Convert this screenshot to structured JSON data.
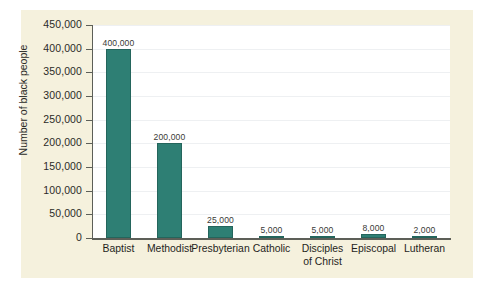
{
  "chart_data": {
    "type": "bar",
    "title": "",
    "subtitle": "",
    "xlabel": "",
    "ylabel": "Number of black people",
    "ylim": [
      0,
      450000
    ],
    "ytick_step": 50000,
    "grid": true,
    "legend": "none",
    "bar_color": "#2e7f74",
    "plot_background": "#ffffff",
    "panel_background": "#f5f1dd",
    "categories": [
      "Baptist",
      "Methodist",
      "Presbyterian",
      "Catholic",
      "Disciples of Christ",
      "Episcopal",
      "Lutheran"
    ],
    "category_lines": [
      [
        "Baptist"
      ],
      [
        "Methodist"
      ],
      [
        "Presbyterian"
      ],
      [
        "Catholic"
      ],
      [
        "Disciples",
        "of Christ"
      ],
      [
        "Episcopal"
      ],
      [
        "Lutheran"
      ]
    ],
    "values": [
      400000,
      200000,
      25000,
      5000,
      5000,
      8000,
      2000
    ],
    "value_labels": [
      "400,000",
      "200,000",
      "25,000",
      "5,000",
      "5,000",
      "8,000",
      "2,000"
    ],
    "ytick_labels": [
      "450,000",
      "400,000",
      "350,000",
      "300,000",
      "250,000",
      "200,000",
      "150,000",
      "100,000",
      "50,000",
      "0"
    ],
    "ytick_values": [
      450000,
      400000,
      350000,
      300000,
      250000,
      200000,
      150000,
      100000,
      50000,
      0
    ]
  }
}
